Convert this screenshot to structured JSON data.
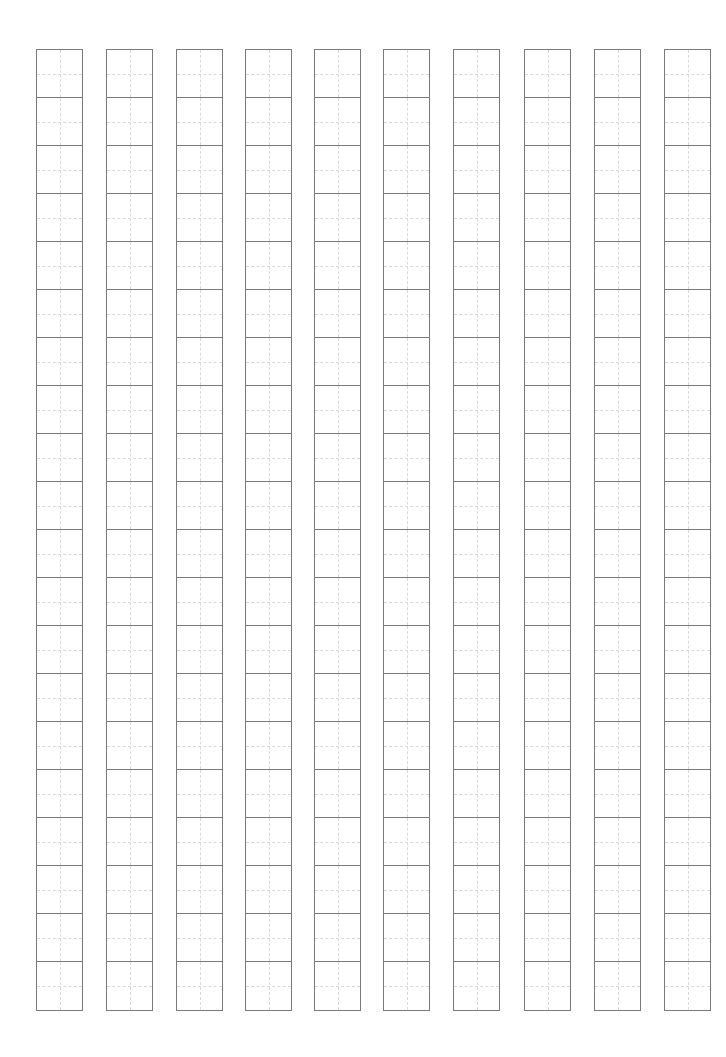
{
  "sheet": {
    "type": "character-practice-grid",
    "columns": 10,
    "cells_per_column": 20,
    "column_x": [
      36,
      106,
      176,
      245,
      314,
      383,
      453,
      524,
      594,
      664
    ],
    "column_width": 47,
    "grid_top": 49,
    "cell_height": 48,
    "colors": {
      "background": "#ffffff",
      "border": "#7a7a7a",
      "guide": "#d9d9d9"
    }
  }
}
